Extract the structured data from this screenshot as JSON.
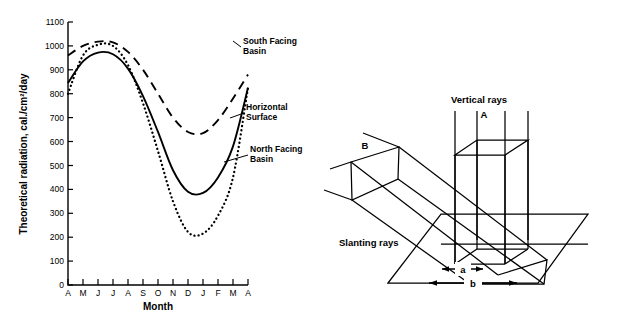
{
  "figure": {
    "panels": [
      "radiation-chart",
      "ray-geometry-diagram"
    ]
  },
  "chart_data": {
    "type": "line",
    "title": "",
    "xlabel": "Month",
    "ylabel": "Theoretical radiation, cal./cm²/day",
    "ylim": [
      0,
      1100
    ],
    "ytick_values": [
      0,
      100,
      200,
      300,
      400,
      500,
      600,
      700,
      800,
      900,
      1000,
      1100
    ],
    "ytick_labels": [
      "0",
      "100",
      "200",
      "300",
      "400",
      "500",
      "600",
      "700",
      "800",
      "900",
      "1000",
      "1100"
    ],
    "categories": [
      "A",
      "M",
      "J",
      "J",
      "A",
      "S",
      "O",
      "N",
      "D",
      "J",
      "F",
      "M",
      "A"
    ],
    "xtick_labels": [
      "A",
      "M",
      "J",
      "J",
      "A",
      "S",
      "O",
      "N",
      "D",
      "J",
      "F",
      "M",
      "A"
    ],
    "grid": false,
    "legend_position": "inline-annotations",
    "series": [
      {
        "name": "South Facing Basin",
        "style": "dashed",
        "values": [
          960,
          1000,
          1018,
          1015,
          975,
          900,
          800,
          700,
          640,
          635,
          690,
          780,
          880
        ]
      },
      {
        "name": "Horizontal Surface",
        "style": "solid",
        "values": [
          845,
          935,
          972,
          965,
          905,
          790,
          640,
          480,
          390,
          385,
          450,
          580,
          825
        ]
      },
      {
        "name": "North Facing Basin",
        "style": "dotted",
        "values": [
          800,
          960,
          1005,
          1000,
          920,
          760,
          560,
          350,
          222,
          215,
          290,
          450,
          825
        ]
      }
    ],
    "annotations": [
      {
        "label": "South Facing Basin",
        "series": "South Facing Basin"
      },
      {
        "label": "Horizontal Surface",
        "series": "Horizontal Surface"
      },
      {
        "label": "North Facing Basin",
        "series": "North Facing Basin"
      }
    ]
  },
  "diagram": {
    "title": "",
    "labels": {
      "vertical_rays": "Vertical rays",
      "slanting_rays": "Slanting rays",
      "beam_a": "A",
      "beam_b": "B",
      "dim_a": "a",
      "dim_b": "b"
    }
  }
}
